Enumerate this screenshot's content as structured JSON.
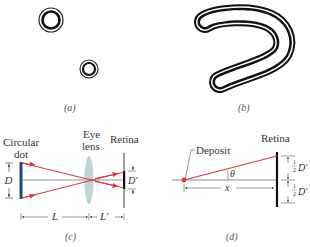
{
  "figure": {
    "panels": [
      {
        "id": "a",
        "caption": "(a)",
        "description": "Two circular floater deposits seen as diffraction ring patterns"
      },
      {
        "id": "b",
        "caption": "(b)",
        "description": "Chain of floater deposits forming a curved ring pattern"
      },
      {
        "id": "c",
        "caption": "(c)",
        "labels": {
          "dot": "Circular",
          "dot2": "dot",
          "lens1": "Eye",
          "lens2": "lens",
          "retina": "Retina",
          "D": "D",
          "Dprime": "D'",
          "L": "L",
          "Lprime": "L'"
        }
      },
      {
        "id": "d",
        "caption": "(d)",
        "labels": {
          "deposit": "Deposit",
          "retina": "Retina",
          "theta": "θ",
          "x": "x",
          "half": "1",
          "two": "2",
          "Dprime": "D'"
        }
      }
    ],
    "colors": {
      "ray": "#d9363e",
      "ink": "#222222",
      "dot": "#1f4e6e",
      "lens": "#b9cccc"
    }
  }
}
